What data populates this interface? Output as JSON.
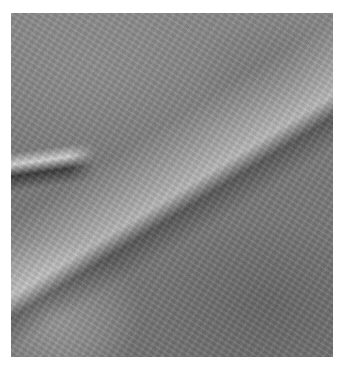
{
  "image": {
    "description": "Grayscale aerial/orbital view of rugged terrain with a bright diagonal ridge band running from lower-left to upper-right",
    "colors": {
      "background": "#ffffff",
      "terrain_mid": "#7d7d7d",
      "highlight": "#ebebeb",
      "shadow": "#3c3c3c"
    }
  }
}
